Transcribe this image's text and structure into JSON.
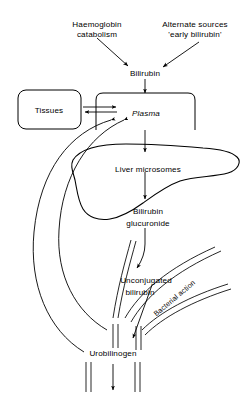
{
  "diagram": {
    "background_color": "#ffffff",
    "line_color": "#000000",
    "nodes": {
      "haemoglobin_catabolism_line1": "Haemoglobin",
      "haemoglobin_catabolism_line2": "catabolism",
      "alternate_sources_line1": "Alternate sources",
      "alternate_sources_line2": "'early bilirubin'",
      "bilirubin": "Bilirubin",
      "tissues": "Tissues",
      "plasma": "Plasma",
      "liver_microsomes": "Liver microsomes",
      "bilirubin_glucuronide_line1": "Bilirubin",
      "bilirubin_glucuronide_line2": "glucuronide",
      "unconjugated_bilirubin_line1": "Unconjugated",
      "unconjugated_bilirubin_line2": "bilirubin",
      "bacterial_action": "Bacterial action",
      "urobilinogen": "Urobilinogen"
    }
  }
}
